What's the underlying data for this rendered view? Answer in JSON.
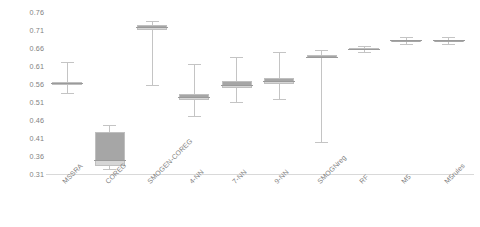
{
  "chart_data": {
    "type": "box",
    "title": "",
    "xlabel": "",
    "ylabel": "",
    "ylim": [
      0.31,
      0.76
    ],
    "ytick_labels": [
      "0.76",
      "0.71",
      "0.66",
      "0.61",
      "0.56",
      "0.51",
      "0.46",
      "0.41",
      "0.36",
      "0.31"
    ],
    "ytick_values": [
      0.76,
      0.71,
      0.66,
      0.61,
      0.56,
      0.51,
      0.46,
      0.41,
      0.36,
      0.31
    ],
    "grid": false,
    "legend": "none",
    "categories": [
      "MSSRA",
      "COREG",
      "SMOGEN-COREG",
      "4-NN",
      "7-NN",
      "9-NN",
      "SMOGNreg",
      "RF",
      "M5",
      "M5rules"
    ],
    "boxes": [
      {
        "name": "MSSRA",
        "min": 0.535,
        "q1": 0.558,
        "median": 0.562,
        "q3": 0.566,
        "max": 0.622
      },
      {
        "name": "COREG",
        "min": 0.323,
        "q1": 0.332,
        "median": 0.35,
        "q3": 0.427,
        "max": 0.446
      },
      {
        "name": "SMOGEN-COREG",
        "min": 0.556,
        "q1": 0.71,
        "median": 0.718,
        "q3": 0.724,
        "max": 0.734
      },
      {
        "name": "4-NN",
        "min": 0.47,
        "q1": 0.515,
        "median": 0.523,
        "q3": 0.532,
        "max": 0.616
      },
      {
        "name": "7-NN",
        "min": 0.51,
        "q1": 0.549,
        "median": 0.558,
        "q3": 0.568,
        "max": 0.636
      },
      {
        "name": "9-NN",
        "min": 0.518,
        "q1": 0.56,
        "median": 0.567,
        "q3": 0.576,
        "max": 0.648
      },
      {
        "name": "SMOGNreg",
        "min": 0.4,
        "q1": 0.632,
        "median": 0.636,
        "q3": 0.641,
        "max": 0.655
      },
      {
        "name": "RF",
        "min": 0.65,
        "q1": 0.656,
        "median": 0.658,
        "q3": 0.66,
        "max": 0.665
      },
      {
        "name": "M5",
        "min": 0.67,
        "q1": 0.679,
        "median": 0.681,
        "q3": 0.683,
        "max": 0.69
      },
      {
        "name": "M5rules",
        "min": 0.67,
        "q1": 0.679,
        "median": 0.681,
        "q3": 0.683,
        "max": 0.69
      }
    ]
  },
  "colors": {
    "box_lower_fill": "#d6d6d6",
    "box_upper_fill": "#a6a6a6",
    "box_border": "#bfbfbf",
    "whisker": "#c4c4c4",
    "median": "#9a9a9a",
    "axis": "#d9d9d9",
    "tick_text": "#7f7f7f",
    "background": "#ffffff"
  }
}
